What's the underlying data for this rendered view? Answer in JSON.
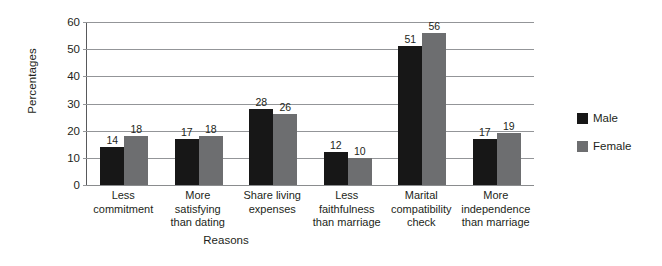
{
  "chart_data": {
    "type": "bar",
    "title": "",
    "xlabel": "Reasons",
    "ylabel": "Percentages",
    "ylim": [
      0,
      60
    ],
    "yticks": [
      0,
      10,
      20,
      30,
      40,
      50,
      60
    ],
    "grid": true,
    "legend_position": "right",
    "categories": [
      "Less commitment",
      "More satisfying than dating",
      "Share living expenses",
      "Less faithfulness than marriage",
      "Marital compatibility check",
      "More independence than marriage"
    ],
    "category_lines": [
      [
        "Less",
        "commitment"
      ],
      [
        "More",
        "satisfying",
        "than dating"
      ],
      [
        "Share living",
        "expenses"
      ],
      [
        "Less",
        "faithfulness",
        "than marriage"
      ],
      [
        "Marital",
        "compatibility",
        "check"
      ],
      [
        "More",
        "independence",
        "than marriage"
      ]
    ],
    "series": [
      {
        "name": "Male",
        "color": "#171717",
        "values": [
          14,
          17,
          28,
          12,
          51,
          17
        ]
      },
      {
        "name": "Female",
        "color": "#6d6e70",
        "values": [
          18,
          18,
          26,
          10,
          56,
          19
        ]
      }
    ]
  }
}
